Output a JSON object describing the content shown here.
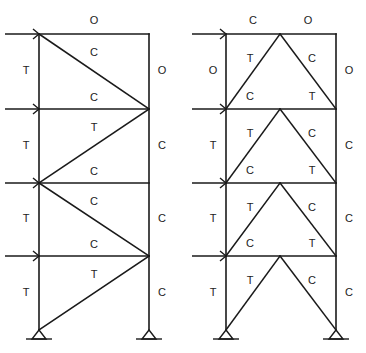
{
  "diagram": {
    "title": "",
    "colors": {
      "line": "#1a1a1a",
      "text": "#222222",
      "background": "#ffffff"
    },
    "legend": {
      "T": "Tension",
      "C": "Compression",
      "O": "Zero force"
    },
    "levels_y": [
      34,
      109,
      183,
      256,
      330
    ],
    "frames": [
      {
        "name": "single-diagonal-braced-frame",
        "left_x": 39,
        "right_x": 149,
        "labels": {
          "top_beam": "O",
          "story1": {
            "left_column": "T",
            "right_column": "O",
            "diagonal": "C",
            "beam_below": "C"
          },
          "story2": {
            "left_column": "T",
            "right_column": "C",
            "diagonal": "T",
            "beam_below": "C"
          },
          "story3": {
            "left_column": "T",
            "right_column": "C",
            "diagonal": "C",
            "beam_below": "C"
          },
          "story4": {
            "left_column": "T",
            "right_column": "C",
            "diagonal": "T"
          }
        }
      },
      {
        "name": "chevron-braced-frame",
        "left_x": 226,
        "right_x": 336,
        "apex_x": 280,
        "labels": {
          "top_beam_left": "C",
          "top_beam_right": "O",
          "story1": {
            "left_column": "O",
            "right_column": "O",
            "left_brace": "T",
            "right_brace": "C",
            "beam_left": "C",
            "beam_right": "T"
          },
          "story2": {
            "left_column": "T",
            "right_column": "C",
            "left_brace": "T",
            "right_brace": "C",
            "beam_left": "C",
            "beam_right": "T"
          },
          "story3": {
            "left_column": "T",
            "right_column": "C",
            "left_brace": "T",
            "right_brace": "C",
            "beam_left": "C",
            "beam_right": "T"
          },
          "story4": {
            "left_column": "T",
            "right_column": "C",
            "left_brace": "T",
            "right_brace": "C"
          }
        }
      }
    ]
  }
}
